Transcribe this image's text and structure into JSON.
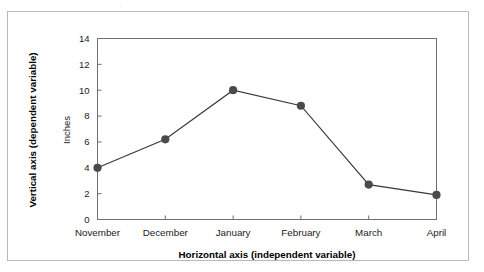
{
  "figure": {
    "background_color": "#ffffff",
    "frame_color": "#b9b9bb",
    "top_crop_artifact": "."
  },
  "chart_data": {
    "type": "line",
    "title": "",
    "subtitle": "",
    "xlabel": "Horizontal axis (independent variable)",
    "ylabel": "Vertical axis (dependent variable)",
    "y_unit_label": "Inches",
    "categories": [
      "November",
      "December",
      "January",
      "February",
      "March",
      "April"
    ],
    "values": [
      4.0,
      6.2,
      10.0,
      8.8,
      2.7,
      1.9
    ],
    "ylim": [
      0,
      14
    ],
    "yticks": [
      0,
      2,
      4,
      6,
      8,
      10,
      12,
      14
    ],
    "ytick_labels": [
      "0",
      "2",
      "4",
      "6",
      "8",
      "10",
      "12",
      "14"
    ],
    "grid": false,
    "legend": null,
    "legend_position": "none",
    "series": [
      {
        "name": "",
        "values": [
          4.0,
          6.2,
          10.0,
          8.8,
          2.7,
          1.9
        ],
        "line_color": "#3a3a3a",
        "marker_color": "#4a4a4a",
        "marker": "circle"
      }
    ],
    "annotations": []
  },
  "colors": {
    "line": "#3a3a3a",
    "marker": "#4a4a4a",
    "axis": "#6f6f72",
    "text": "#1b1b1b",
    "frame": "#b9b9bb"
  }
}
